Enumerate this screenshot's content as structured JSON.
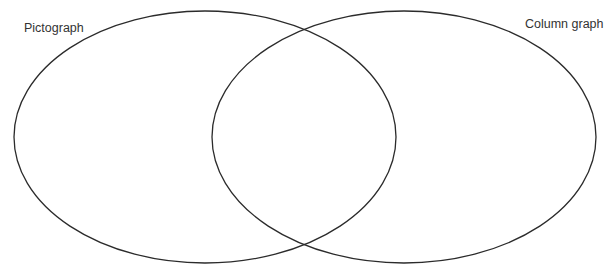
{
  "diagram": {
    "type": "venn",
    "sets": [
      {
        "id": "left",
        "label": "Pictograph",
        "shape": "ellipse",
        "cx": 205,
        "cy": 137,
        "rx": 191,
        "ry": 126
      },
      {
        "id": "right",
        "label": "Column graph",
        "shape": "ellipse",
        "cx": 404,
        "cy": 137,
        "rx": 192,
        "ry": 126
      }
    ],
    "stroke_color": "#2b2b2b",
    "background_color": "#ffffff"
  }
}
